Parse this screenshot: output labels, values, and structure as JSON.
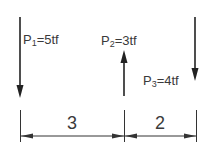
{
  "diagram": {
    "type": "beam-loads",
    "forces": [
      {
        "id": "P1",
        "symbol": "P",
        "subscript": "1",
        "eq": "=5tf",
        "value": 5,
        "unit": "tf",
        "direction": "down"
      },
      {
        "id": "P2",
        "symbol": "P",
        "subscript": "2",
        "eq": "=3tf",
        "value": 3,
        "unit": "tf",
        "direction": "up"
      },
      {
        "id": "P3",
        "symbol": "P",
        "subscript": "3",
        "eq": "=4tf",
        "value": 4,
        "unit": "tf",
        "direction": "down"
      }
    ],
    "dimensions": [
      {
        "label": "3",
        "from": "P1",
        "to": "P2"
      },
      {
        "label": "2",
        "from": "P2",
        "to": "P3"
      }
    ],
    "colors": {
      "line": "#222222",
      "text": "#3a3a3a",
      "background": "#ffffff"
    }
  }
}
